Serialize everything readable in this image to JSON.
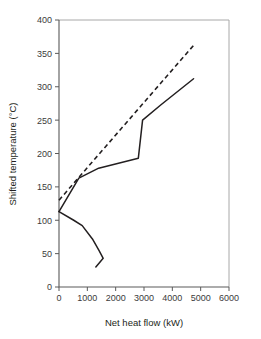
{
  "chart_data": {
    "type": "line",
    "title": "",
    "xlabel": "Net heat flow (kW)",
    "ylabel": "Shifted temperature (°C)",
    "xlim": [
      0,
      6000
    ],
    "ylim": [
      0,
      400
    ],
    "xticks": [
      0,
      1000,
      2000,
      3000,
      4000,
      5000,
      6000
    ],
    "yticks": [
      0,
      50,
      100,
      150,
      200,
      250,
      300,
      350,
      400
    ],
    "xtick_labels": [
      "0",
      "1000",
      "2000",
      "3000",
      "4000",
      "5000",
      "6000"
    ],
    "ytick_labels": [
      "0",
      "50",
      "100",
      "150",
      "200",
      "250",
      "300",
      "350",
      "400"
    ],
    "grid": false,
    "legend": null,
    "series": [
      {
        "name": "grand-composite-curve",
        "style": "solid",
        "color": "#231f20",
        "points": [
          [
            0,
            113
          ],
          [
            700,
            163
          ],
          [
            1400,
            178
          ],
          [
            2800,
            193
          ],
          [
            2950,
            250
          ],
          [
            3600,
            273
          ],
          [
            4750,
            312
          ]
        ]
      },
      {
        "name": "grand-composite-lower-branch",
        "style": "solid",
        "color": "#231f20",
        "points": [
          [
            0,
            113
          ],
          [
            520,
            100
          ],
          [
            820,
            92
          ],
          [
            1180,
            72
          ],
          [
            1420,
            54
          ],
          [
            1560,
            43
          ],
          [
            1300,
            30
          ]
        ]
      },
      {
        "name": "reference-line",
        "style": "dashed",
        "color": "#231f20",
        "points": [
          [
            0,
            130
          ],
          [
            4750,
            362
          ]
        ]
      }
    ]
  },
  "axes": {
    "x_title": "Net heat flow (kW)",
    "y_title": "Shifted temperature (°C)"
  }
}
